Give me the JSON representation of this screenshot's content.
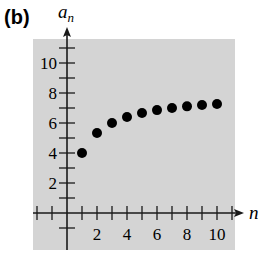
{
  "panel_label": "(b)",
  "colors": {
    "plot_background": "#d4d4d4",
    "axis": "#1a1a1a",
    "points": "#000000"
  },
  "chart_data": {
    "type": "scatter",
    "title": "",
    "panel_label": "(b)",
    "xlabel": "n",
    "ylabel": "a_n",
    "x": [
      1,
      2,
      3,
      4,
      5,
      6,
      7,
      8,
      9,
      10
    ],
    "values": [
      4.0,
      5.33,
      6.0,
      6.4,
      6.67,
      6.86,
      7.0,
      7.11,
      7.2,
      7.27
    ],
    "xlim": [
      -2,
      11.5
    ],
    "ylim": [
      -1.5,
      11.5
    ],
    "x_ticks": [
      2,
      4,
      6,
      8,
      10
    ],
    "y_ticks": [
      2,
      4,
      6,
      8,
      10
    ],
    "x_minor_ticks": [
      -2,
      -1,
      1,
      2,
      3,
      4,
      5,
      6,
      7,
      8,
      9,
      10,
      11
    ],
    "y_minor_ticks": [
      -1,
      1,
      2,
      3,
      4,
      5,
      6,
      7,
      8,
      9,
      10,
      11
    ],
    "grid": false,
    "legend": null
  }
}
